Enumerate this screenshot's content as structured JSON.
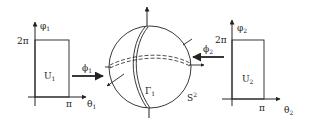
{
  "figure": {
    "left_chart": {
      "y_axis_label": "φ",
      "y_axis_sub": "1",
      "x_axis_label": "θ",
      "x_axis_sub": "1",
      "y_tick": "2π",
      "x_tick": "π",
      "region_label": "U",
      "region_sub": "1"
    },
    "left_map": {
      "label": "ϕ",
      "sub": "1"
    },
    "sphere": {
      "curve_label": "Γ",
      "curve_sub": "1",
      "surface_label": "S",
      "surface_sup": "2"
    },
    "right_map": {
      "label": "ϕ",
      "sub": "2"
    },
    "right_chart": {
      "y_axis_label": "φ",
      "y_axis_sub": "2",
      "x_axis_label": "θ",
      "x_axis_sub": "2",
      "y_tick": "2π",
      "x_tick": "π",
      "region_label": "U",
      "region_sub": "2"
    },
    "colors": {
      "stroke": "#222222",
      "background": "#ffffff"
    }
  }
}
